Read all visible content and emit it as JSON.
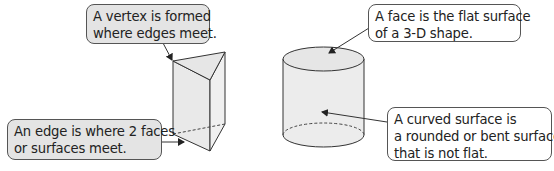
{
  "callouts": {
    "vertex": {
      "lines": [
        "A vertex is formed",
        "where edges meet."
      ]
    },
    "edge": {
      "lines": [
        "An edge is where 2 faces",
        "or surfaces meet."
      ]
    },
    "face": {
      "lines": [
        "A face is the flat surface",
        "of a 3-D shape."
      ]
    },
    "curved": {
      "lines": [
        "A curved surface is",
        "a rounded or bent surface",
        "that is not flat."
      ]
    }
  },
  "shapes": [
    "triangular-prism",
    "cylinder"
  ],
  "colors": {
    "shape_fill": "#ececec",
    "shape_stroke": "#333333",
    "grey_callout": "#e4e4e4",
    "white_callout": "#ffffff"
  }
}
